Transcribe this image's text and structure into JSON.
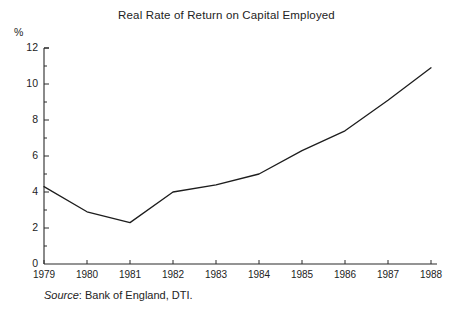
{
  "chart_data": {
    "type": "line",
    "title": "Real Rate of Return on Capital Employed",
    "xlabel": "",
    "ylabel": "%",
    "ylim": [
      0,
      12
    ],
    "ytick_step": 2,
    "yminor_step": 1,
    "grid": false,
    "legend": "none",
    "categories": [
      "1979",
      "1980",
      "1981",
      "1982",
      "1983",
      "1984",
      "1985",
      "1986",
      "1987",
      "1988"
    ],
    "x": [
      1979,
      1980,
      1981,
      1982,
      1983,
      1984,
      1985,
      1986,
      1987,
      1988
    ],
    "values": [
      4.3,
      2.9,
      2.3,
      4.0,
      4.4,
      5.0,
      6.3,
      7.4,
      9.1,
      10.9
    ],
    "series": [
      {
        "name": "Real rate of return on capital employed",
        "values": [
          4.3,
          2.9,
          2.3,
          4.0,
          4.4,
          5.0,
          6.3,
          7.4,
          9.1,
          10.9
        ]
      }
    ],
    "ytick_labels": [
      "0",
      "2",
      "4",
      "6",
      "8",
      "10",
      "12"
    ],
    "ytick_values": [
      0,
      2,
      4,
      6,
      8,
      10,
      12
    ],
    "annotations": [],
    "line_color": "#1d1d1d",
    "axis_color": "#2a2a2a"
  },
  "axis": {
    "unit_label": "%"
  },
  "footer": {
    "source_word": "Source",
    "source_text": ": Bank of England, DTI."
  }
}
